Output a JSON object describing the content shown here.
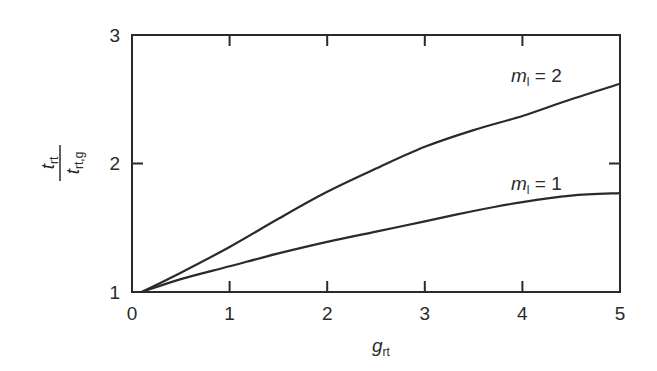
{
  "chart_data": {
    "type": "line",
    "title": "",
    "xlabel": "g_rt",
    "ylabel": "t_rt / t_rt,g",
    "xlim": [
      0,
      5
    ],
    "ylim": [
      1,
      3
    ],
    "grid": false,
    "legend_position": "inline labels near curve ends",
    "x_ticks": [
      "0",
      "1",
      "2",
      "3",
      "4",
      "5"
    ],
    "y_ticks": [
      "1",
      "2",
      "3"
    ],
    "series": [
      {
        "name": "m_l = 2",
        "x": [
          0.1,
          0.5,
          1,
          1.5,
          2,
          2.5,
          3,
          3.5,
          4,
          4.5,
          5
        ],
        "values": [
          1.0,
          1.15,
          1.35,
          1.57,
          1.78,
          1.96,
          2.13,
          2.26,
          2.37,
          2.5,
          2.62
        ]
      },
      {
        "name": "m_l = 1",
        "x": [
          0.1,
          0.5,
          1,
          1.5,
          2,
          2.5,
          3,
          3.5,
          4,
          4.5,
          5
        ],
        "values": [
          1.0,
          1.1,
          1.2,
          1.3,
          1.39,
          1.47,
          1.55,
          1.63,
          1.7,
          1.75,
          1.77
        ]
      }
    ]
  },
  "labels": {
    "x_axis_main": "g",
    "x_axis_sub": "rt",
    "y_num_main": "t",
    "y_num_sub": "rt",
    "y_den_main": "t",
    "y_den_sub": "rt,g",
    "curve2_main": "m",
    "curve2_sub": "l",
    "curve2_eq": " = 2",
    "curve1_main": "m",
    "curve1_sub": "l",
    "curve1_eq": " = 1"
  },
  "ticks": {
    "x": [
      "0",
      "1",
      "2",
      "3",
      "4",
      "5"
    ],
    "y": [
      "1",
      "2",
      "3"
    ]
  },
  "colors": {
    "line": "#2a2a2a",
    "background": "#ffffff"
  }
}
